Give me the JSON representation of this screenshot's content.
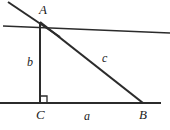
{
  "figure": {
    "stroke_color": "#2b2b2b",
    "background_color": "#ffffff",
    "vertices": [
      {
        "name": "A",
        "label": "A",
        "x": 40,
        "y": 22
      },
      {
        "name": "B",
        "label": "B",
        "x": 143,
        "y": 103
      },
      {
        "name": "C",
        "label": "C",
        "x": 40,
        "y": 103
      }
    ],
    "sides": [
      {
        "name": "a",
        "label": "a",
        "from": "C",
        "to": "B",
        "role": "horizontal-leg"
      },
      {
        "name": "b",
        "label": "b",
        "from": "A",
        "to": "C",
        "role": "vertical-leg"
      },
      {
        "name": "c",
        "label": "c",
        "from": "A",
        "to": "B",
        "role": "hypotenuse"
      }
    ],
    "right_angle": {
      "at": "C",
      "marker": "square",
      "size": 7
    },
    "lines": {
      "baseline": {
        "x1": 0,
        "y1": 103,
        "x2": 161,
        "y2": 103
      },
      "transversal": {
        "x1": 3,
        "y1": 26,
        "x2": 170,
        "y2": 33
      },
      "oblique_ray": {
        "x1": 8,
        "y1": 2,
        "x2": 60,
        "y2": 37
      },
      "leg_b": {
        "x1": 40,
        "y1": 22,
        "x2": 40,
        "y2": 103
      },
      "hypotenuse_c": {
        "x1": 40,
        "y1": 22,
        "x2": 143,
        "y2": 103
      }
    }
  }
}
